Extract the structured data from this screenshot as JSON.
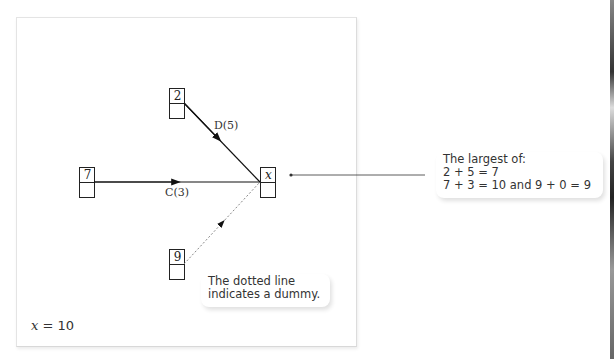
{
  "diagram": {
    "nodes": [
      {
        "id": "n7",
        "top_label": "7",
        "bottom_label": ""
      },
      {
        "id": "n2",
        "top_label": "2",
        "bottom_label": ""
      },
      {
        "id": "n9",
        "top_label": "9",
        "bottom_label": ""
      },
      {
        "id": "nx",
        "top_label": "x",
        "bottom_label": ""
      }
    ],
    "edges": [
      {
        "from": "n2",
        "to": "nx",
        "label": "D(5)",
        "style": "solid"
      },
      {
        "from": "n7",
        "to": "nx",
        "label": "C(3)",
        "style": "solid"
      },
      {
        "from": "n9",
        "to": "nx",
        "label": "",
        "style": "dotted"
      }
    ],
    "result": {
      "variable": "x",
      "equals": " = ",
      "value": "10"
    }
  },
  "notes": {
    "dummy": [
      "The dotted line",
      "indicates a dummy."
    ],
    "largest": [
      "The largest of:",
      "2 + 5 = 7",
      "7 + 3 = 10 and 9 + 0 = 9"
    ]
  },
  "colors": {
    "line": "#111111",
    "dotted": "#888888",
    "text": "#333333"
  }
}
